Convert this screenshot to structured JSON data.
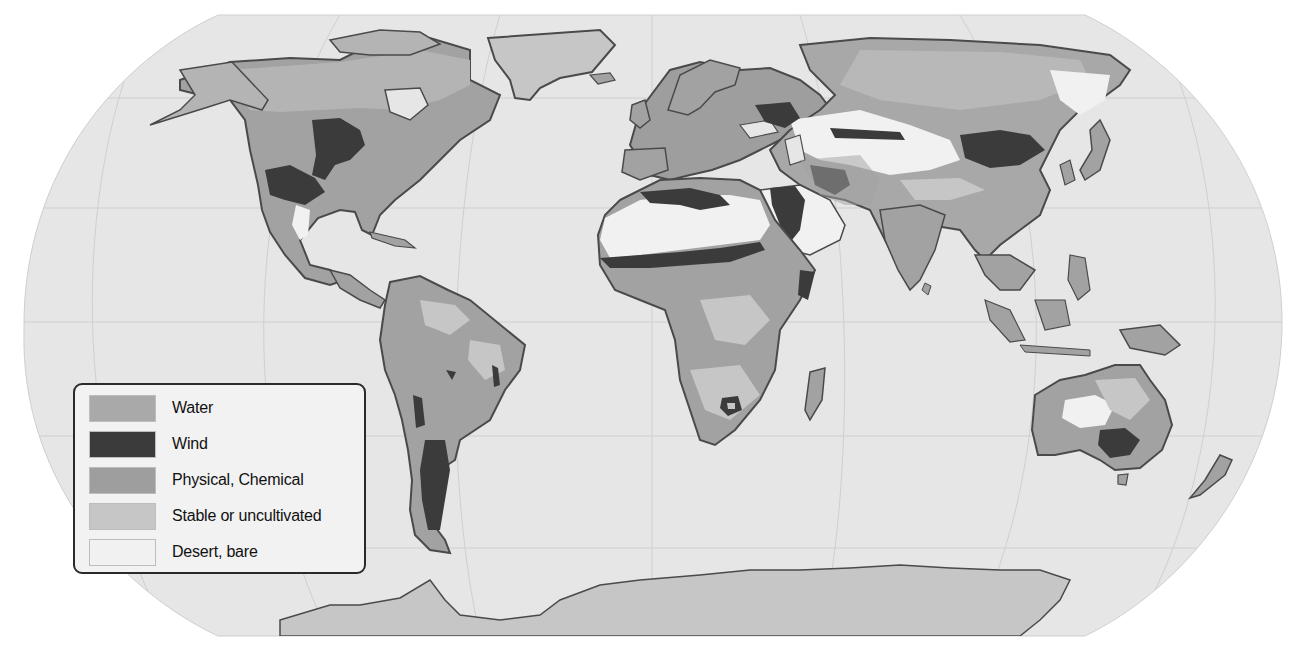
{
  "map": {
    "type": "world-map",
    "projection": "robinson-like",
    "theme": "Soil degradation types",
    "background_color": "#ffffff",
    "ocean_color": "#e6e6e6",
    "graticule_color": "#cfcfcf",
    "coastline_color": "#4a4a4a"
  },
  "legend": {
    "items": [
      {
        "label": "Water",
        "color": "#a9a9a9"
      },
      {
        "label": "Wind",
        "color": "#3b3b3b"
      },
      {
        "label": "Physical, Chemical",
        "color": "#9e9e9e"
      },
      {
        "label": "Stable or uncultivated",
        "color": "#c6c6c6"
      },
      {
        "label": "Desert, bare",
        "color": "#f1f1f1"
      }
    ]
  }
}
